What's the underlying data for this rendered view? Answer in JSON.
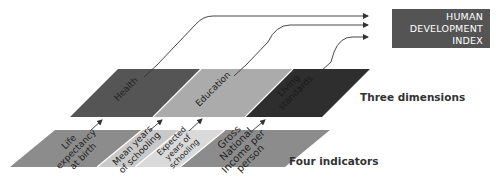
{
  "hdi": {
    "lines": [
      "HUMAN",
      "DEVELOPMENT",
      "INDEX"
    ],
    "color": "#545454",
    "text_color": "#ffffff"
  },
  "dimensions": {
    "row_label": "Three dimensions",
    "items": [
      {
        "label": "Health",
        "color": "#555555"
      },
      {
        "label": "Education",
        "color": "#ababab"
      },
      {
        "label": "Living standards",
        "label_lines": [
          "Living",
          "standards"
        ],
        "color": "#2e2e2e"
      }
    ]
  },
  "indicators": {
    "row_label": "Four indicators",
    "items": [
      {
        "label": "Life expectancy at birth",
        "label_lines": [
          "Life",
          "expectancy",
          "at birth"
        ],
        "color": "#8c8c8c"
      },
      {
        "label": "Mean years of schooling",
        "label_lines": [
          "Mean years",
          "of schooling"
        ],
        "color": "#c9c9c9"
      },
      {
        "label": "Expected years of schooling",
        "label_lines": [
          "Expected",
          "years of",
          "schooling"
        ],
        "color": "#dadada"
      },
      {
        "label": "Gross National Income per person",
        "label_lines": [
          "Gross",
          "National",
          "Income per",
          "person"
        ],
        "color": "#8c8c8c"
      }
    ]
  },
  "colors": {
    "arrow": "#333333",
    "background": "#ffffff"
  }
}
